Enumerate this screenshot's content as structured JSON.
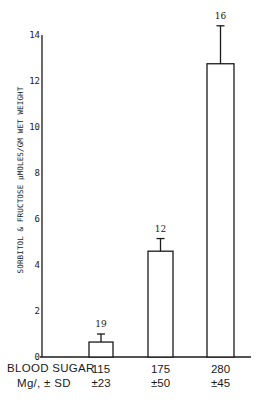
{
  "chart_data": {
    "type": "bar",
    "title": "",
    "ylabel": "SORBITOL & FRUCTOSE μMOLES/GM WET WEIGHT",
    "xlabel": "BLOOD SUGAR Mg/, ± SD",
    "ylim": [
      0,
      14
    ],
    "yticks": [
      0,
      2,
      4,
      6,
      8,
      10,
      12,
      14
    ],
    "grid": false,
    "legend": null,
    "categories": [
      "115 ±23",
      "175 ±50",
      "280 ±45"
    ],
    "values": [
      0.65,
      4.6,
      12.75
    ],
    "error_upper": [
      1.0,
      5.15,
      14.4
    ],
    "n_labels": [
      "19",
      "12",
      "16"
    ]
  },
  "axis": {
    "y_label": "SORBITOL & FRUCTOSE μMOLES/GM WET WEIGHT",
    "ticks": [
      "0",
      "2",
      "4",
      "6",
      "8",
      "10",
      "12",
      "14"
    ]
  },
  "x_caption": {
    "line1": "BLOOD SUGAR",
    "line2": "Mg/, ± SD"
  },
  "groups": [
    {
      "mean": "115",
      "sd": "±23",
      "n": "19"
    },
    {
      "mean": "175",
      "sd": "±50",
      "n": "12"
    },
    {
      "mean": "280",
      "sd": "±45",
      "n": "16"
    }
  ]
}
